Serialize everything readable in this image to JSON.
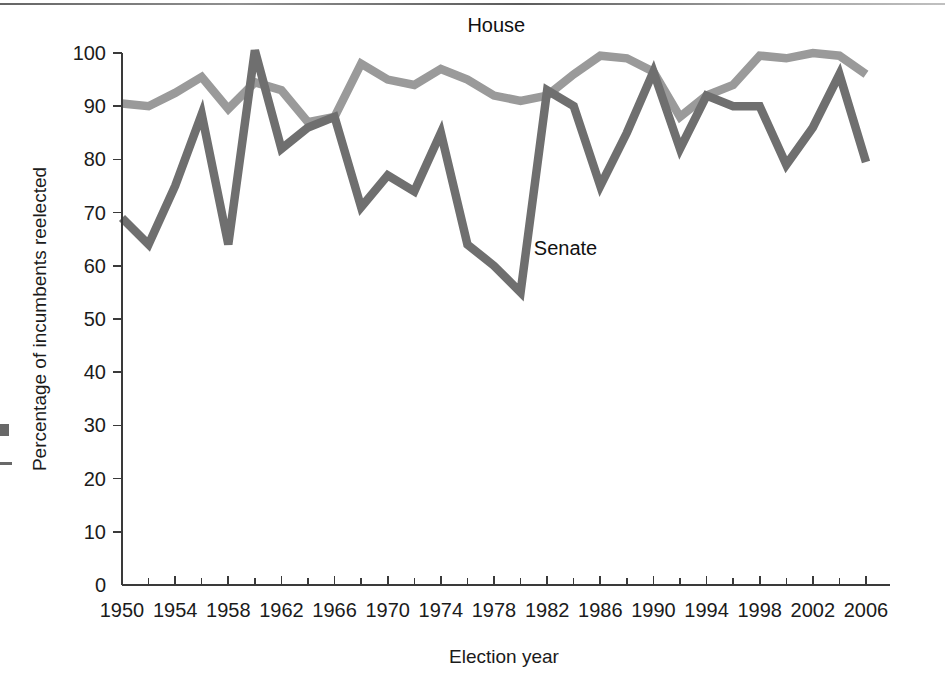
{
  "chart_data": {
    "type": "line",
    "title": "",
    "xlabel": "Election year",
    "ylabel": "Percentage of incumbents reelected",
    "xlim": [
      1950,
      2006
    ],
    "ylim": [
      0,
      100
    ],
    "grid": false,
    "legend_position": "inline-annotation",
    "x_tick_labels": [
      "1950",
      "1954",
      "1958",
      "1962",
      "1966",
      "1970",
      "1974",
      "1978",
      "1982",
      "1986",
      "1990",
      "1994",
      "1998",
      "2002",
      "2006"
    ],
    "x_tick_values": [
      1950,
      1954,
      1958,
      1962,
      1966,
      1970,
      1974,
      1978,
      1982,
      1986,
      1990,
      1994,
      1998,
      2002,
      2006
    ],
    "x_minor_tick_values": [
      1952,
      1956,
      1960,
      1964,
      1968,
      1972,
      1976,
      1980,
      1984,
      1988,
      1992,
      1996,
      2000,
      2004
    ],
    "y_tick_labels": [
      "0",
      "10",
      "20",
      "30",
      "40",
      "50",
      "60",
      "70",
      "80",
      "90",
      "100"
    ],
    "y_tick_values": [
      0,
      10,
      20,
      30,
      40,
      50,
      60,
      70,
      80,
      90,
      100
    ],
    "x": [
      1950,
      1952,
      1954,
      1956,
      1958,
      1960,
      1962,
      1964,
      1966,
      1968,
      1970,
      1972,
      1974,
      1976,
      1978,
      1980,
      1982,
      1984,
      1986,
      1988,
      1990,
      1992,
      1994,
      1996,
      1998,
      2000,
      2002,
      2004,
      2006
    ],
    "series": [
      {
        "name": "House",
        "color": "#9a9a9a",
        "label_year": 1976,
        "label_value": 104,
        "values": [
          90.5,
          90.0,
          92.5,
          95.5,
          89.5,
          94.5,
          93.0,
          87.0,
          88.0,
          98.0,
          95.0,
          94.0,
          97.0,
          95.0,
          92.0,
          91.0,
          92.0,
          96.0,
          99.5,
          99.0,
          96.5,
          88.0,
          92.0,
          94.0,
          99.5,
          99.0,
          100.0,
          99.5,
          96.0
        ]
      },
      {
        "name": "Senate",
        "color": "#6f6f6f",
        "label_year": 1981,
        "label_value": 62,
        "values": [
          69.0,
          64.0,
          75.0,
          88.5,
          64.0,
          100.5,
          82.0,
          86.0,
          88.0,
          71.0,
          77.0,
          74.0,
          85.0,
          64.0,
          60.0,
          55.0,
          93.0,
          90.0,
          75.0,
          85.0,
          96.5,
          82.0,
          92.0,
          90.0,
          90.0,
          79.0,
          86.0,
          96.0,
          79.5
        ]
      }
    ]
  },
  "figure": {
    "background_color": "#ffffff",
    "axis_color": "#3a3a3a",
    "text_color": "#1b1b1b"
  }
}
